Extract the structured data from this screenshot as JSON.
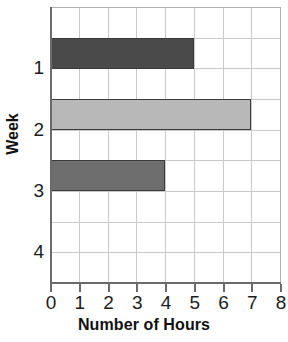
{
  "chart_data": {
    "type": "bar",
    "orientation": "horizontal",
    "title": "",
    "xlabel": "Number of Hours",
    "ylabel": "Week",
    "categories": [
      "1",
      "2",
      "3",
      "4"
    ],
    "values": [
      5,
      7,
      4,
      0
    ],
    "xlim": [
      0,
      8
    ],
    "x_ticks": [
      "0",
      "1",
      "2",
      "3",
      "4",
      "5",
      "6",
      "7",
      "8"
    ],
    "y_ticks": [
      "1",
      "2",
      "3",
      "4"
    ],
    "grid": true,
    "legend": null,
    "bar_colors": [
      "#4a4a4a",
      "#b8b8b8",
      "#6e6e6e",
      "#ffffff"
    ],
    "bar_edge_color": "#3a3a3a",
    "grid_color": "#c9c9c9",
    "axis_color": "#6b6b6b",
    "background": "#ffffff",
    "bars": [
      {
        "category": "1",
        "value": 5,
        "color": "#4a4a4a"
      },
      {
        "category": "2",
        "value": 7,
        "color": "#b8b8b8"
      },
      {
        "category": "3",
        "value": 4,
        "color": "#6e6e6e"
      },
      {
        "category": "4",
        "value": 0,
        "color": "#ffffff"
      }
    ]
  }
}
